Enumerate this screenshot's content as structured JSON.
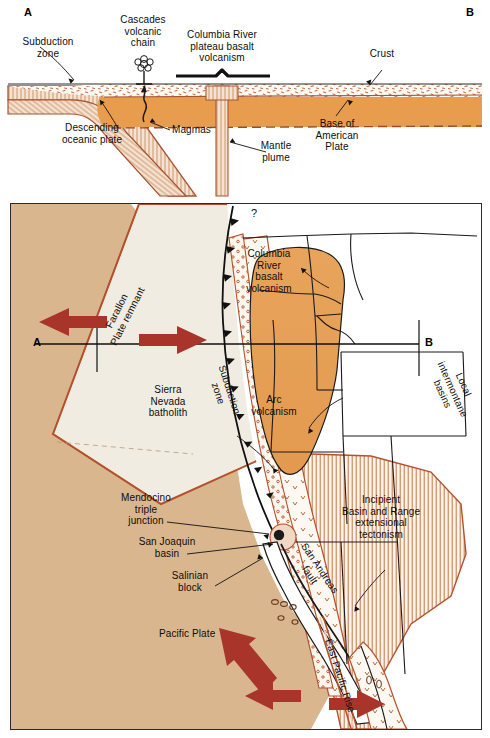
{
  "figure": {
    "panels": {
      "cross_section_left_letter": "A",
      "cross_section_right_letter": "B",
      "map_transect_left_letter": "A",
      "map_transect_right_letter": "B"
    }
  },
  "cross_section": {
    "labels": {
      "subduction_zone": "Subduction\nzone",
      "cascades_volcanic_chain": "Cascades\nvolcanic\nchain",
      "columbia_river_plateau": "Columbia River\nplateau basalt\nvolcanism",
      "crust": "Crust",
      "descending_oceanic_plate": "Descending\noceanic plate",
      "magmas": "Magmas",
      "mantle_plume": "Mantle\nplume",
      "base_of_american_plate": "Base of\nAmerican\nPlate"
    }
  },
  "map": {
    "labels": {
      "farallon_plate_remnant": "Farallon\nPlate remnant",
      "subduction_zone": "Subduction\nzone",
      "sierra_nevada_batholith": "Sierra\nNevada\nbatholith",
      "columbia_river_basalt": "Columbia\nRiver\nbasalt\nvolcanism",
      "local_intermontane_basins": "Local\nintermontane\nbasins",
      "arc_volcanism": "Arc\nvolcanism",
      "incipient_basin_and_range": "Incipient\nBasin and Range\nextensional\ntectonism",
      "mendocino_triple_junction": "Mendocino\ntriple\njunction",
      "san_joaquin_basin": "San Joaquin\nbasin",
      "salinian_block": "Salinian\nblock",
      "san_andreas_fault": "San Andreas\nfault",
      "pacific_plate": "Pacific Plate",
      "east_pacific_rise": "East Pacific Rise",
      "query_marker": "?"
    }
  },
  "colors": {
    "mantle_orange": "#e79c4e",
    "basalt_orange": "#e8a65c",
    "plate_tan": "#dcb68c",
    "ocean_tan": "#d9b288",
    "arrow_red": "#a8342a",
    "fault_brown": "#b4512c",
    "outline_black": "#1a1a1a",
    "crust_white": "#fbf6ee",
    "continent_white": "#ffffff",
    "land_cream": "#f2ece1"
  }
}
